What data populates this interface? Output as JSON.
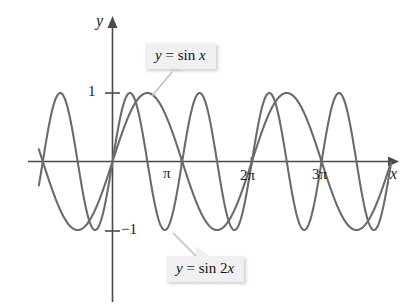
{
  "figure": {
    "background_color": "#ffffff",
    "curve_color": "#6b6b6b",
    "axis_color": "#4a4a4a",
    "callout_background": "#f0f0f0"
  },
  "axes": {
    "x_axis_label": "x",
    "y_axis_label": "y"
  },
  "ticks": {
    "y_positive_one": "1",
    "y_negative_one": "−1",
    "x_pi": "π",
    "x_two_pi": "2π",
    "x_three_pi": "3π"
  },
  "callouts": {
    "sin_x": {
      "prefix": "y",
      "equals": " = sin ",
      "variable": "x",
      "full_text": "y = sin x"
    },
    "sin_2x": {
      "prefix": "y",
      "equals": " = sin 2",
      "variable": "x",
      "full_text": "y = sin 2x"
    }
  },
  "chart_data": {
    "type": "line",
    "title": "",
    "xlabel": "x",
    "ylabel": "y",
    "xlim": [
      -3.35,
      12.6
    ],
    "ylim": [
      -1.35,
      1.35
    ],
    "grid": false,
    "legend": "callout-annotations",
    "x_tick_values": [
      3.141592653589793,
      6.283185307179586,
      9.42477796076938
    ],
    "x_tick_labels": [
      "π",
      "2π",
      "3π"
    ],
    "y_tick_values": [
      1,
      -1
    ],
    "y_tick_labels": [
      "1",
      "−1"
    ],
    "series": [
      {
        "name": "y = sin x",
        "expression": "sin(x)",
        "amplitude": 1,
        "period": 6.283185307179586,
        "color": "#6b6b6b",
        "x_start": -3.32,
        "x_end": 12.55
      },
      {
        "name": "y = sin 2x",
        "expression": "sin(2x)",
        "amplitude": 1,
        "period": 3.141592653589793,
        "color": "#6b6b6b",
        "x_start": -3.32,
        "x_end": 12.55
      }
    ],
    "annotations": [
      {
        "text": "y = sin x",
        "points_to_x": 0.57,
        "points_to_y": 0.96
      },
      {
        "text": "y = sin 2x",
        "points_to_x": 0.86,
        "points_to_y": -1.03
      }
    ]
  }
}
